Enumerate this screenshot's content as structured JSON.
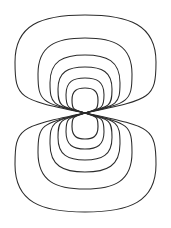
{
  "figure": {
    "kind": "contour-diagram",
    "width": 171,
    "height": 228,
    "background_color": "#ffffff",
    "line_color": "#2b2b2b",
    "line_width": 1.05,
    "node_point": {
      "x": 85,
      "y": 113
    },
    "axis_of_symmetry": "vertical",
    "lobe_count": 2,
    "contours_per_lobe": 6,
    "labels": [],
    "title": "",
    "axis_labels": []
  },
  "chart_data": {
    "type": "contour",
    "title": "",
    "xlabel": "",
    "ylabel": "",
    "grid": false,
    "legend": "none",
    "xlim": [
      0,
      171
    ],
    "ylim": [
      0,
      228
    ],
    "center_node": {
      "x": 85,
      "y": 113
    },
    "lobes": [
      {
        "name": "upper-lobe",
        "sign": "+",
        "contours": [
          {
            "level": 1,
            "half_width": 71,
            "top_y": 15,
            "left_x": 15,
            "right_x": 156
          },
          {
            "level": 2,
            "half_width": 47,
            "top_y": 38,
            "left_x": 38,
            "right_x": 132
          },
          {
            "level": 3,
            "half_width": 35,
            "top_y": 55,
            "left_x": 50,
            "right_x": 120
          },
          {
            "level": 4,
            "half_width": 27,
            "top_y": 67,
            "left_x": 58,
            "right_x": 112
          },
          {
            "level": 5,
            "half_width": 19,
            "top_y": 78,
            "left_x": 66,
            "right_x": 104
          },
          {
            "level": 6,
            "half_width": 13,
            "top_y": 88,
            "left_x": 72,
            "right_x": 98
          }
        ]
      },
      {
        "name": "lower-lobe",
        "sign": "-",
        "contours": [
          {
            "level": 1,
            "half_width": 71,
            "bottom_y": 212,
            "left_x": 15,
            "right_x": 156
          },
          {
            "level": 2,
            "half_width": 47,
            "bottom_y": 189,
            "left_x": 38,
            "right_x": 132
          },
          {
            "level": 3,
            "half_width": 35,
            "bottom_y": 172,
            "left_x": 50,
            "right_x": 120
          },
          {
            "level": 4,
            "half_width": 27,
            "bottom_y": 160,
            "left_x": 58,
            "right_x": 112
          },
          {
            "level": 5,
            "half_width": 19,
            "bottom_y": 149,
            "left_x": 66,
            "right_x": 104
          },
          {
            "level": 6,
            "half_width": 13,
            "bottom_y": 139,
            "left_x": 72,
            "right_x": 98
          }
        ]
      }
    ]
  }
}
